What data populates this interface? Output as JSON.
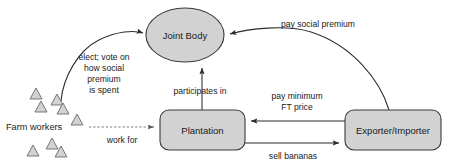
{
  "diagram": {
    "background_color": "#ffffff",
    "shape_fill_color": "#d2d2d2",
    "shape_stroke_color": "#3a3a3a",
    "text_color": "#1a1a1a",
    "nodes": {
      "joint_body": {
        "label": "Joint Body",
        "shape": "ellipse"
      },
      "plantation": {
        "label": "Plantation",
        "shape": "rounded-rectangle"
      },
      "exporter_importer": {
        "label": "Exporter/Importer",
        "shape": "rounded-rectangle"
      },
      "farm_workers": {
        "label": "Farm workers",
        "shape": "triangle-cluster",
        "triangle_count": 8
      }
    },
    "edges": {
      "workers_to_joint_body": {
        "label_line_1": "elect; vote on",
        "label_line_2": "how social",
        "label_line_3": "premium",
        "label_line_4": "is spent",
        "style": "solid-curve",
        "from": "farm_workers",
        "to": "joint_body"
      },
      "plantation_to_joint_body": {
        "label": "participates in",
        "style": "solid-straight",
        "from": "plantation",
        "to": "joint_body"
      },
      "exporter_to_joint_body": {
        "label": "pay social premium",
        "style": "solid-curve",
        "from": "exporter_importer",
        "to": "joint_body"
      },
      "exporter_to_plantation": {
        "label_line_1": "pay minimum",
        "label_line_2": "FT price",
        "style": "solid-straight",
        "from": "exporter_importer",
        "to": "plantation"
      },
      "plantation_to_exporter": {
        "label": "sell bananas",
        "style": "solid-straight",
        "from": "plantation",
        "to": "exporter_importer"
      },
      "workers_to_plantation": {
        "label": "work for",
        "style": "dashed-straight",
        "from": "farm_workers",
        "to": "plantation"
      }
    }
  }
}
